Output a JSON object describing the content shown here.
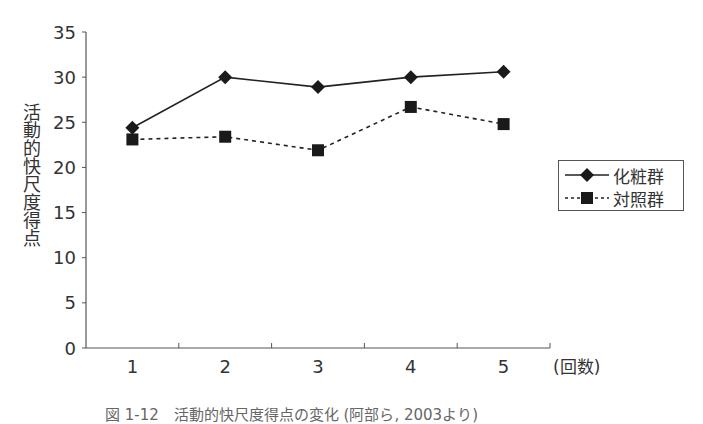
{
  "chart_data": {
    "type": "line",
    "title": "",
    "xlabel": "(回数)",
    "ylabel": "活動的快尺度得点",
    "categories": [
      "1",
      "2",
      "3",
      "4",
      "5"
    ],
    "ylim": [
      0,
      35
    ],
    "yticks": [
      0,
      5,
      10,
      15,
      20,
      25,
      30,
      35
    ],
    "grid": false,
    "legend_position": "right",
    "series": [
      {
        "name": "化粧群",
        "marker": "diamond",
        "line": "solid",
        "color": "#222222",
        "values": [
          24.4,
          30.0,
          28.9,
          30.0,
          30.6
        ]
      },
      {
        "name": "対照群",
        "marker": "square",
        "line": "dashed",
        "color": "#222222",
        "values": [
          23.1,
          23.4,
          21.9,
          26.7,
          24.8
        ]
      }
    ]
  },
  "axis": {
    "ylabel": "活動的快尺度得点",
    "xunit": "(回数)",
    "yticks": [
      "0",
      "5",
      "10",
      "15",
      "20",
      "25",
      "30",
      "35"
    ],
    "xticks": [
      "1",
      "2",
      "3",
      "4",
      "5"
    ]
  },
  "legend": {
    "items": [
      {
        "label": "化粧群"
      },
      {
        "label": "対照群"
      }
    ]
  },
  "caption": "図 1-12　活動的快尺度得点の変化 (阿部ら, 2003より)"
}
